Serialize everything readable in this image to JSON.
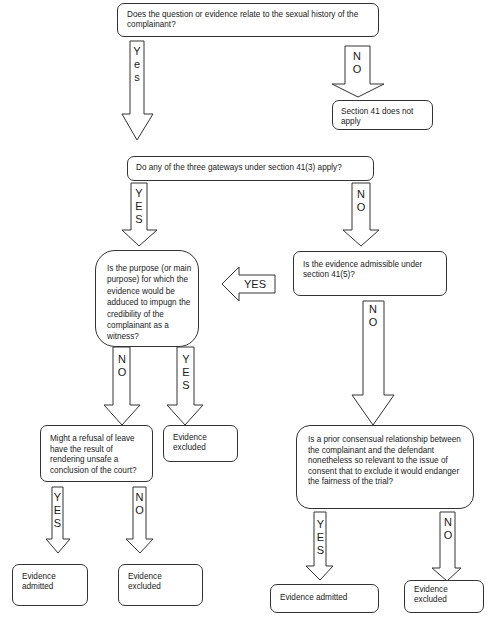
{
  "diagram": {
    "nodes": {
      "q_sexual_history": "Does the question or evidence relate to the sexual history of the complainant?",
      "section41_not_apply": "Section 41 does not apply",
      "q_gateways": "Do any of the three gateways under section 41(3) apply?",
      "q_purpose": "Is the purpose (or main purpose) for which the evidence would be adduced to impugn the credibility of the complainant as a witness?",
      "q_admissible_41_5": "Is the evidence admissible under section 41(5)?",
      "q_refusal_of_leave": "Might a refusal of leave have the result of rendering unsafe a conclusion of the court?",
      "evidence_excluded_purpose": "Evidence excluded",
      "q_prior_relationship": "Is a prior consensual relationship between the complainant and the defendant nonetheless so relevant to the issue of consent that  to exclude it would endanger the fairness of the trial?",
      "evidence_admitted_refusal": "Evidence admitted",
      "evidence_excluded_refusal": "Evidence excluded",
      "evidence_admitted_prior": "Evidence admitted",
      "evidence_excluded_prior": "Evidence excluded"
    },
    "edges": {
      "e1_yes": "Y\ne\ns",
      "e1_no": "N\nO",
      "e2_yes": "Y\nE\nS",
      "e2_no": "N\nO",
      "e3_yes_left": "YES",
      "e4_no": "N\nO",
      "e5_no": "N\nO",
      "e5_yes": "Y\nE\nS",
      "e6_yes": "Y\nE\nS",
      "e6_no": "N\nO",
      "e7_yes": "Y\nE\nS",
      "e7_no": "N\nO"
    },
    "colors": {
      "stroke": "#333333",
      "fill": "#ffffff",
      "text": "#1a1a1a"
    }
  }
}
